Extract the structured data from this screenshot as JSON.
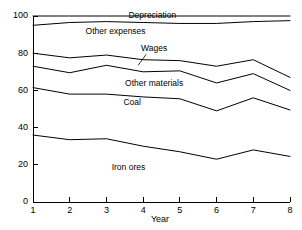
{
  "chart_data": {
    "type": "area",
    "title": "",
    "subtitle": "",
    "xlabel": "Year",
    "ylabel": "",
    "x": [
      1,
      2,
      3,
      4,
      5,
      6,
      7,
      8
    ],
    "xtick_labels": [
      "1",
      "2",
      "3",
      "4",
      "5",
      "6",
      "7",
      "8"
    ],
    "ytick_labels": [
      "0",
      "20",
      "40",
      "60",
      "80",
      "100"
    ],
    "ytick_values": [
      0,
      20,
      40,
      60,
      80,
      100
    ],
    "xlim": [
      1,
      8
    ],
    "ylim": [
      0,
      100
    ],
    "grid": false,
    "legend": "inline-band-labels",
    "stacking": "cumulative-percent",
    "boundary_series": [
      {
        "name": "top-100-line",
        "label": "Depreciation",
        "values": [
          100,
          100,
          100,
          100,
          100,
          100,
          100,
          100
        ]
      },
      {
        "name": "depreciation-lower-boundary",
        "label": "Other expenses",
        "values": [
          95,
          96.5,
          97,
          96.5,
          96,
          96,
          97,
          97.5
        ]
      },
      {
        "name": "other-expenses-lower-boundary",
        "label": "Wages",
        "values": [
          80,
          77.5,
          79,
          76.5,
          76,
          73,
          76.5,
          67
        ]
      },
      {
        "name": "wages-lower-boundary",
        "label": "Other materials",
        "values": [
          73,
          69.5,
          73.5,
          70,
          70.5,
          64,
          69,
          60
        ]
      },
      {
        "name": "other-materials-lower-boundary",
        "label": "Coal",
        "values": [
          61.5,
          58,
          58,
          56.5,
          55.5,
          49,
          56,
          49.5
        ]
      },
      {
        "name": "coal-lower-boundary",
        "label": "Iron ores",
        "values": [
          36,
          33.5,
          34,
          30,
          27,
          23,
          28,
          24.5
        ]
      }
    ],
    "band_labels": [
      {
        "text": "Depreciation",
        "x": 4.25,
        "y": 98.8,
        "leader": false
      },
      {
        "text": "Other expenses",
        "x": 3.25,
        "y": 90.5,
        "leader": false
      },
      {
        "text": "Wages",
        "x": 4.3,
        "y": 81.0,
        "leader": true
      },
      {
        "text": "Other materials",
        "x": 4.3,
        "y": 62.5,
        "leader": false
      },
      {
        "text": "Coal",
        "x": 3.7,
        "y": 52.0,
        "leader": false
      },
      {
        "text": "Iron ores",
        "x": 3.6,
        "y": 17.0,
        "leader": false
      }
    ],
    "colors": {
      "axis": "#000000",
      "line": "#000000",
      "background": "#ffffff",
      "text": "#000000"
    }
  },
  "axis": {
    "x_title": "Year"
  }
}
